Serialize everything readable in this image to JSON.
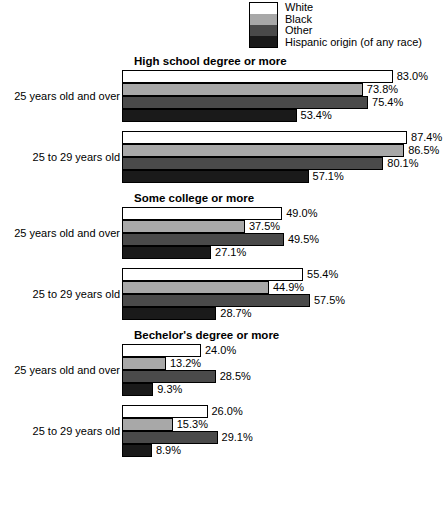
{
  "legend": {
    "items": [
      {
        "label": "White",
        "color": "#ffffff",
        "key": "white"
      },
      {
        "label": "Black",
        "color": "#a8a8a8",
        "key": "black"
      },
      {
        "label": "Other",
        "color": "#4a4a4a",
        "key": "other"
      },
      {
        "label": "Hispanic origin (of any race)",
        "color": "#1a1a1a",
        "key": "hisp"
      }
    ]
  },
  "chart_data": {
    "type": "bar",
    "orientation": "horizontal",
    "title": "",
    "xlabel": "",
    "ylabel": "",
    "xlim": [
      0,
      100
    ],
    "grid": false,
    "legend_position": "top",
    "unit": "%",
    "series_names": [
      "White",
      "Black",
      "Other",
      "Hispanic origin (of any race)"
    ],
    "panels": [
      {
        "title": "High school degree or more",
        "categories": [
          "25 years old and over",
          "25 to 29 years old"
        ],
        "groups": [
          {
            "category": "25 years old and over",
            "bars": [
              {
                "series": "White",
                "value": 83.0,
                "label": "83.0%",
                "key": "white"
              },
              {
                "series": "Black",
                "value": 73.8,
                "label": "73.8%",
                "key": "black"
              },
              {
                "series": "Other",
                "value": 75.4,
                "label": "75.4%",
                "key": "other"
              },
              {
                "series": "Hispanic origin (of any race)",
                "value": 53.4,
                "label": "53.4%",
                "key": "hisp"
              }
            ]
          },
          {
            "category": "25 to 29 years old",
            "bars": [
              {
                "series": "White",
                "value": 87.4,
                "label": "87.4%",
                "key": "white"
              },
              {
                "series": "Black",
                "value": 86.5,
                "label": "86.5%",
                "key": "black"
              },
              {
                "series": "Other",
                "value": 80.1,
                "label": "80.1%",
                "key": "other"
              },
              {
                "series": "Hispanic origin (of any race)",
                "value": 57.1,
                "label": "57.1%",
                "key": "hisp"
              }
            ]
          }
        ]
      },
      {
        "title": "Some college or more",
        "categories": [
          "25 years old and over",
          "25 to 29 years old"
        ],
        "groups": [
          {
            "category": "25 years old and over",
            "bars": [
              {
                "series": "White",
                "value": 49.0,
                "label": "49.0%",
                "key": "white"
              },
              {
                "series": "Black",
                "value": 37.5,
                "label": "37.5%",
                "key": "black"
              },
              {
                "series": "Other",
                "value": 49.5,
                "label": "49.5%",
                "key": "other"
              },
              {
                "series": "Hispanic origin (of any race)",
                "value": 27.1,
                "label": "27.1%",
                "key": "hisp"
              }
            ]
          },
          {
            "category": "25 to 29 years old",
            "bars": [
              {
                "series": "White",
                "value": 55.4,
                "label": "55.4%",
                "key": "white"
              },
              {
                "series": "Black",
                "value": 44.9,
                "label": "44.9%",
                "key": "black"
              },
              {
                "series": "Other",
                "value": 57.5,
                "label": "57.5%",
                "key": "other"
              },
              {
                "series": "Hispanic origin (of any race)",
                "value": 28.7,
                "label": "28.7%",
                "key": "hisp"
              }
            ]
          }
        ]
      },
      {
        "title": "Bechelor's degree or more",
        "categories": [
          "25 years old and over",
          "25 to 29 years old"
        ],
        "groups": [
          {
            "category": "25 years old and over",
            "bars": [
              {
                "series": "White",
                "value": 24.0,
                "label": "24.0%",
                "key": "white"
              },
              {
                "series": "Black",
                "value": 13.2,
                "label": "13.2%",
                "key": "black"
              },
              {
                "series": "Other",
                "value": 28.5,
                "label": "28.5%",
                "key": "other"
              },
              {
                "series": "Hispanic origin (of any race)",
                "value": 9.3,
                "label": "9.3%",
                "key": "hisp"
              }
            ]
          },
          {
            "category": "25 to 29 years old",
            "bars": [
              {
                "series": "White",
                "value": 26.0,
                "label": "26.0%",
                "key": "white"
              },
              {
                "series": "Black",
                "value": 15.3,
                "label": "15.3%",
                "key": "black"
              },
              {
                "series": "Other",
                "value": 29.1,
                "label": "29.1%",
                "key": "other"
              },
              {
                "series": "Hispanic origin (of any race)",
                "value": 8.9,
                "label": "8.9%",
                "key": "hisp"
              }
            ]
          }
        ]
      }
    ]
  }
}
